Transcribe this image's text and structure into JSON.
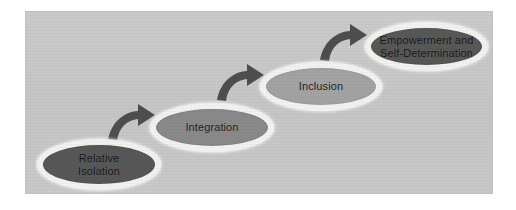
{
  "diagram": {
    "type": "process-flow",
    "title": "",
    "background_color": "#c9c9c9",
    "canvas_color": "#ffffff",
    "arrow_color": "#4e4e4e",
    "ring_color": "#f2f2ee",
    "stages": [
      {
        "id": "relative-isolation",
        "label": "Relative\nIsolation",
        "order": 1,
        "fill": "#585858",
        "text_color": "#171717"
      },
      {
        "id": "integration",
        "label": "Integration",
        "order": 2,
        "fill": "#8a8a8a",
        "text_color": "#1d1d1d"
      },
      {
        "id": "inclusion",
        "label": "Inclusion",
        "order": 3,
        "fill": "#a3a3a3",
        "text_color": "#1d1d1d"
      },
      {
        "id": "empowerment-and-self-determination",
        "label": "Empowerment and\nSelf-Determination",
        "order": 4,
        "fill": "#585858",
        "text_color": "#171717"
      }
    ],
    "connectors": [
      {
        "id": "arrow-1",
        "icon": "curved-arrow-up-right-icon",
        "from": "relative-isolation",
        "to": "integration"
      },
      {
        "id": "arrow-2",
        "icon": "curved-arrow-up-right-icon",
        "from": "integration",
        "to": "inclusion"
      },
      {
        "id": "arrow-3",
        "icon": "curved-arrow-up-right-icon",
        "from": "inclusion",
        "to": "empowerment-and-self-determination"
      }
    ]
  }
}
